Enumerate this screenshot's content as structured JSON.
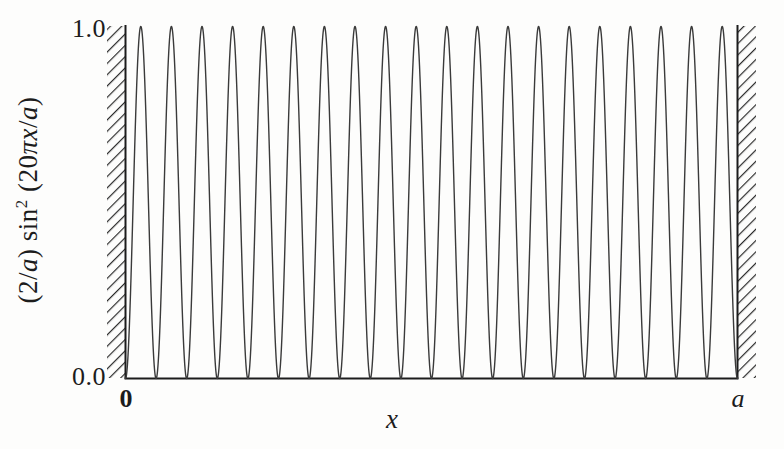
{
  "figure": {
    "background_color": "#fdfdfc",
    "axis_color": "#1c1c1c",
    "curve_color": "#3a3a3a",
    "hatch_color": "#2b2b2b"
  },
  "axes": {
    "y_label_parts": {
      "prefix": "(2/",
      "a1": "a",
      "mid": ") sin",
      "exponent": "2",
      "open": " (20",
      "pi": "π",
      "x": "x",
      "slash": "/",
      "a2": "a",
      "close": ")"
    },
    "y_label_plain": "(2/a) sin² (20πx/a)",
    "y_ticks": [
      "1.0",
      "0.0"
    ],
    "y_tick_values": [
      1.0,
      0.0
    ],
    "x_ticks": [
      "0",
      "a"
    ],
    "x_label": "x"
  },
  "walls": {
    "left_label": "left-potential-wall",
    "right_label": "right-potential-wall",
    "hatch_angle_deg": 45,
    "hatch_spacing_px": 6
  },
  "chart_data": {
    "type": "line",
    "title": "",
    "subtitle": "",
    "xlabel": "x",
    "ylabel": "(2/a) sin² (20πx/a)",
    "xlim": [
      0,
      1
    ],
    "ylim": [
      0.0,
      1.0
    ],
    "xtick_labels": [
      "0",
      "a"
    ],
    "xtick_positions": [
      0,
      1
    ],
    "ytick_labels": [
      "0.0",
      "1.0"
    ],
    "ytick_positions": [
      0.0,
      1.0
    ],
    "grid": false,
    "legend": null,
    "annotations": [
      {
        "text": "0",
        "x": 0,
        "y": -0.06,
        "role": "x-tick"
      },
      {
        "text": "a",
        "x": 1,
        "y": -0.06,
        "role": "x-tick"
      }
    ],
    "series": [
      {
        "name": "(2/a) sin^2(20*pi*x/a)",
        "formula": "sin(20*pi*x)^2",
        "n_quantum_number": 20,
        "num_peaks": 20,
        "num_nodes": 21,
        "peak_value": 1.0,
        "min_value": 0.0,
        "peak_x_positions": [
          0.025,
          0.075,
          0.125,
          0.175,
          0.225,
          0.275,
          0.325,
          0.375,
          0.425,
          0.475,
          0.525,
          0.575,
          0.625,
          0.675,
          0.725,
          0.775,
          0.825,
          0.875,
          0.925,
          0.975
        ],
        "node_x_positions": [
          0.0,
          0.05,
          0.1,
          0.15,
          0.2,
          0.25,
          0.3,
          0.35,
          0.4,
          0.45,
          0.5,
          0.55,
          0.6,
          0.65,
          0.7,
          0.75,
          0.8,
          0.85,
          0.9,
          0.95,
          1.0
        ],
        "peak_values": [
          1,
          1,
          1,
          1,
          1,
          1,
          1,
          1,
          1,
          1,
          1,
          1,
          1,
          1,
          1,
          1,
          1,
          1,
          1,
          1
        ],
        "node_values": [
          0,
          0,
          0,
          0,
          0,
          0,
          0,
          0,
          0,
          0,
          0,
          0,
          0,
          0,
          0,
          0,
          0,
          0,
          0,
          0,
          0
        ],
        "line_width": 1.4,
        "color": "#3a3a3a"
      }
    ]
  }
}
